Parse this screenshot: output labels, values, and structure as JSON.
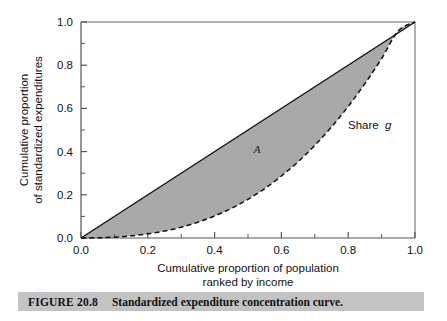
{
  "figure": {
    "caption_label": "FIGURE 20.8",
    "caption_text": "Standardized expenditure concentration curve."
  },
  "chart_data": {
    "type": "line",
    "title": "",
    "subtitle": "",
    "xlabel_line1": "Cumulative proportion of population",
    "xlabel_line2": "ranked by income",
    "ylabel_line1": "Cumulative proportion",
    "ylabel_line2": "of standardized expenditures",
    "xlim": [
      0.0,
      1.0
    ],
    "ylim": [
      0.0,
      1.0
    ],
    "xticks": [
      "0.0",
      "0.2",
      "0.4",
      "0.6",
      "0.8",
      "1.0"
    ],
    "xtick_values": [
      0.0,
      0.2,
      0.4,
      0.6,
      0.8,
      1.0
    ],
    "yticks": [
      "0.0",
      "0.2",
      "0.4",
      "0.6",
      "0.8",
      "1.0"
    ],
    "ytick_values": [
      0.0,
      0.2,
      0.4,
      0.6,
      0.8,
      1.0
    ],
    "minor_tick_step": 0.1,
    "grid": false,
    "legend_position": "inline-annotation",
    "colors": {
      "shaded_area": "#a9a9a9",
      "curve_line": "#111111",
      "diagonal_line": "#111111",
      "axis": "#555555",
      "caption_bar": "#c3c3c3"
    },
    "series": [
      {
        "name": "line-of-equality",
        "style": "solid",
        "x": [
          0.0,
          1.0
        ],
        "values": [
          0.0,
          1.0
        ]
      },
      {
        "name": "Share g",
        "style": "dashed",
        "x": [
          0.0,
          0.05,
          0.1,
          0.15,
          0.2,
          0.25,
          0.3,
          0.35,
          0.4,
          0.45,
          0.5,
          0.55,
          0.6,
          0.65,
          0.7,
          0.75,
          0.8,
          0.85,
          0.9,
          0.95,
          1.0
        ],
        "values": [
          0.0,
          0.001,
          0.004,
          0.01,
          0.019,
          0.032,
          0.05,
          0.073,
          0.102,
          0.137,
          0.179,
          0.229,
          0.287,
          0.353,
          0.429,
          0.514,
          0.609,
          0.715,
          0.831,
          0.959,
          1.0
        ]
      }
    ],
    "annotations": [
      {
        "name": "area-A",
        "text": "A",
        "x": 0.527,
        "y": 0.405,
        "style": "italic"
      },
      {
        "name": "share-g",
        "text": "Share",
        "x": 0.8,
        "y": 0.52,
        "style": "normal"
      },
      {
        "name": "share-g-symbol",
        "text": "g",
        "x": 0.905,
        "y": 0.52,
        "style": "italic"
      }
    ]
  }
}
